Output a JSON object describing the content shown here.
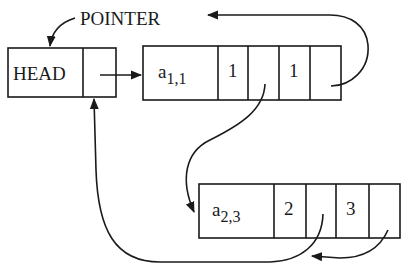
{
  "diagram": {
    "type": "linked-list sparse matrix representation",
    "pointer_label": "POINTER",
    "head": {
      "label": "HEAD",
      "fields": [
        "HEAD",
        "link"
      ]
    },
    "nodes": [
      {
        "id": "node-a11",
        "value": {
          "base": "a",
          "subscript": "1,1"
        },
        "row": "1",
        "col": "1",
        "fields": [
          "a1,1",
          "1",
          "link",
          "1",
          "link"
        ]
      },
      {
        "id": "node-a23",
        "value": {
          "base": "a",
          "subscript": "2,3"
        },
        "row": "2",
        "col": "3",
        "fields": [
          "a2,3",
          "2",
          "link",
          "3",
          "link"
        ]
      }
    ],
    "edges": [
      {
        "from": "head.link",
        "to": "node-a11",
        "style": "straight-arrow"
      },
      {
        "from": "node-a11.link1",
        "to": "node-a23",
        "style": "curved-arrow"
      },
      {
        "from": "node-a11.link2",
        "to": "POINTER",
        "style": "curved-arrow"
      },
      {
        "from": "POINTER",
        "to": "head",
        "style": "curved-arrow"
      },
      {
        "from": "node-a23.link1",
        "to": "head.link",
        "style": "curved-arrow"
      },
      {
        "from": "node-a23.link2",
        "to": "node-a23.link1-path",
        "style": "curved-arrow"
      }
    ],
    "colors": {
      "ink": "#1a1a1a",
      "background": "#ffffff"
    }
  }
}
